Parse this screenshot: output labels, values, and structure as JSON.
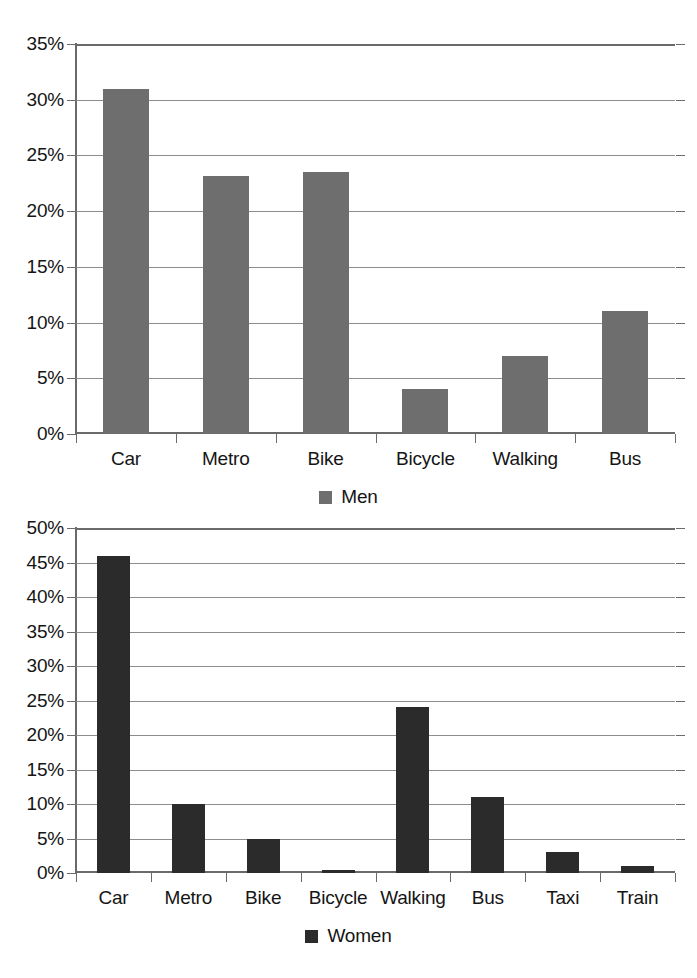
{
  "figure": {
    "background_color": "#ffffff",
    "caption_partial": ""
  },
  "chart_data": [
    {
      "type": "bar",
      "id": "men-modal-split",
      "title": "",
      "xlabel": "",
      "ylabel": "",
      "categories": [
        "Car",
        "Metro",
        "Bike",
        "Bicycle",
        "Walking",
        "Bus"
      ],
      "values": [
        31.0,
        23.2,
        23.5,
        4.0,
        7.0,
        11.0
      ],
      "value_labels": [
        "31%",
        "23.2%",
        "23.5%",
        "4%",
        "7%",
        "11%"
      ],
      "legend": [
        "Men"
      ],
      "legend_position": "bottom-center",
      "series": [
        {
          "name": "Men",
          "values": [
            31.0,
            23.2,
            23.5,
            4.0,
            7.0,
            11.0
          ],
          "color": "#6e6e6e"
        }
      ],
      "ylim": [
        0,
        35
      ],
      "ytick_step": 5,
      "ytick_labels": [
        "0%",
        "5%",
        "10%",
        "15%",
        "20%",
        "25%",
        "30%",
        "35%"
      ],
      "ytick_values": [
        0,
        5,
        10,
        15,
        20,
        25,
        30,
        35
      ],
      "grid": true,
      "grid_axis": "y",
      "bar_color": "#6e6e6e"
    },
    {
      "type": "bar",
      "id": "women-modal-split",
      "title": "",
      "xlabel": "",
      "ylabel": "",
      "categories": [
        "Car",
        "Metro",
        "Bike",
        "Bicycle",
        "Walking",
        "Bus",
        "Taxi",
        "Train"
      ],
      "values": [
        46.0,
        10.0,
        5.0,
        0.5,
        24.0,
        11.0,
        3.0,
        1.0
      ],
      "value_labels": [
        "46%",
        "10%",
        "5%",
        "0.5%",
        "24%",
        "11%",
        "3%",
        "1%"
      ],
      "legend": [
        "Women"
      ],
      "legend_position": "bottom-center",
      "series": [
        {
          "name": "Women",
          "values": [
            46.0,
            10.0,
            5.0,
            0.5,
            24.0,
            11.0,
            3.0,
            1.0
          ],
          "color": "#2b2b2b"
        }
      ],
      "ylim": [
        0,
        50
      ],
      "ytick_step": 5,
      "ytick_labels": [
        "0%",
        "5%",
        "10%",
        "15%",
        "20%",
        "25%",
        "30%",
        "35%",
        "40%",
        "45%",
        "50%"
      ],
      "ytick_values": [
        0,
        5,
        10,
        15,
        20,
        25,
        30,
        35,
        40,
        45,
        50
      ],
      "grid": true,
      "grid_axis": "y",
      "bar_color": "#2b2b2b"
    }
  ]
}
